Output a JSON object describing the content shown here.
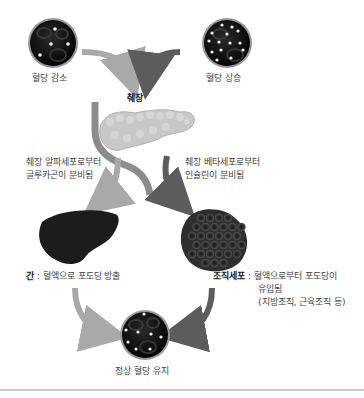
{
  "nodes": {
    "low_glucose": {
      "label": "혈당 감소",
      "icon": "blood-vessel-low-glucose-icon"
    },
    "high_glucose": {
      "label": "혈당 상승",
      "icon": "blood-vessel-high-glucose-icon"
    },
    "pancreas": {
      "label": "췌장",
      "icon": "pancreas-icon"
    },
    "alpha_cells": {
      "lines": [
        "췌장 알파세포로부터",
        "글루카곤이 분비됨"
      ]
    },
    "beta_cells": {
      "lines": [
        "췌장 베타세포로부터",
        "인슐린이 분비됨"
      ]
    },
    "liver": {
      "term": "간",
      "separator": " : ",
      "desc": "혈액으로 포도당 방출",
      "icon": "liver-icon"
    },
    "tissue": {
      "term": "조직세포",
      "separator": " : ",
      "lines": [
        "혈액으로부터 포도당이",
        "유입됨",
        "(지방조직, 근육조직 등)"
      ],
      "icon": "tissue-cells-icon"
    },
    "normal": {
      "label": "정상 혈당 유지",
      "icon": "blood-vessel-normal-glucose-icon"
    }
  },
  "colors": {
    "light_arrow": "#a9a9a9",
    "dark_arrow": "#5c5c5c",
    "vessel": "#111111",
    "organ_dark": "#1c1c1c",
    "pancreas": "#c8c8c8",
    "text": "#444444"
  }
}
